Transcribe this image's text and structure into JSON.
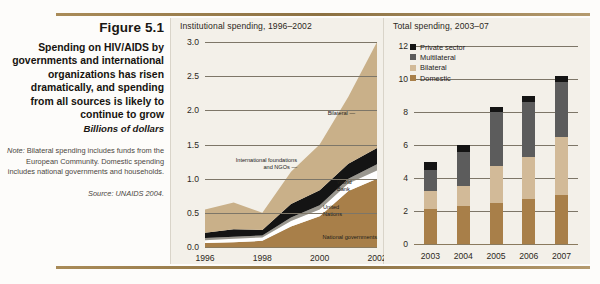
{
  "caption": {
    "figure_number": "Figure 5.1",
    "title": "Spending on HIV/AIDS by governments and international organizations has risen dramatically, and spending from all sources is likely to continue to grow",
    "units": "Billions of dollars",
    "note_label": "Note:",
    "note_text": " Bilateral spending includes funds from the European Community. Domestic spending includes national governments and households.",
    "source": "Source: UNAIDS 2004."
  },
  "colors": {
    "rule": "#8c7142",
    "panel_bg": "#f3f0e9",
    "bilateral": "#c9b089",
    "domestic": "#a87f49",
    "bilateral_bar": "#d2ba98",
    "multilateral": "#5c5c5c",
    "private": "#141414",
    "world_bank": "#9a978f",
    "united_nations": "#ffffff",
    "ngos": "#141414",
    "gridline": "#7d7668"
  },
  "chart_data": [
    {
      "type": "area",
      "title": "Institutional spending, 1996–2002",
      "xlabel": "",
      "ylabel": "",
      "x": [
        1996,
        1997,
        1998,
        1999,
        2000,
        2001,
        2002
      ],
      "xticks": [
        "1996",
        "1998",
        "2000",
        "2002"
      ],
      "yticks": [
        "0.0",
        "0.5",
        "1.0",
        "1.5",
        "2.0",
        "2.5",
        "3.0"
      ],
      "ylim": [
        0.0,
        3.0
      ],
      "grid": true,
      "stacked": true,
      "legend_position": "inline-annotations",
      "series": [
        {
          "name": "National governments",
          "color": "#a87f49",
          "values": [
            0.06,
            0.07,
            0.09,
            0.3,
            0.45,
            0.82,
            1.0
          ]
        },
        {
          "name": "United Nations",
          "color": "#ffffff",
          "values": [
            0.04,
            0.05,
            0.05,
            0.08,
            0.1,
            0.11,
            0.12
          ]
        },
        {
          "name": "World Bank",
          "color": "#9a978f",
          "values": [
            0.03,
            0.03,
            0.03,
            0.05,
            0.06,
            0.07,
            0.09
          ]
        },
        {
          "name": "International foundations and NGOs",
          "color": "#141414",
          "values": [
            0.08,
            0.11,
            0.08,
            0.2,
            0.22,
            0.22,
            0.24
          ]
        },
        {
          "name": "Bilateral",
          "color": "#c9b089",
          "values": [
            0.34,
            0.39,
            0.25,
            0.47,
            0.67,
            0.98,
            1.55
          ]
        }
      ],
      "annotations": [
        {
          "text": "Bilateral",
          "value": 2.15
        },
        {
          "text": "International foundations and NGOs",
          "value": 1.22
        },
        {
          "text": "World Bank",
          "value": 1.05
        },
        {
          "text": "United Nations",
          "value": 0.8
        },
        {
          "text": "National governments",
          "value": 0.2
        }
      ]
    },
    {
      "type": "bar",
      "title": "Total spending, 2003–07",
      "xlabel": "",
      "ylabel": "",
      "categories": [
        "2003",
        "2004",
        "2005",
        "2006",
        "2007"
      ],
      "yticks": [
        "0",
        "2",
        "4",
        "6",
        "8",
        "10",
        "12"
      ],
      "ylim": [
        0,
        12
      ],
      "grid": true,
      "stacked": true,
      "legend_position": "top-left",
      "series": [
        {
          "name": "Domestic",
          "color": "#a87f49",
          "values": [
            2.1,
            2.3,
            2.5,
            2.7,
            3.0
          ]
        },
        {
          "name": "Bilateral",
          "color": "#d2ba98",
          "values": [
            1.1,
            1.2,
            2.2,
            2.6,
            3.5
          ]
        },
        {
          "name": "Multilateral",
          "color": "#5c5c5c",
          "values": [
            1.3,
            2.1,
            3.3,
            3.3,
            3.3
          ]
        },
        {
          "name": "Private sector",
          "color": "#141414",
          "values": [
            0.5,
            0.4,
            0.3,
            0.4,
            0.4
          ]
        }
      ],
      "totals": [
        5.0,
        6.0,
        8.3,
        9.0,
        10.2
      ]
    }
  ]
}
